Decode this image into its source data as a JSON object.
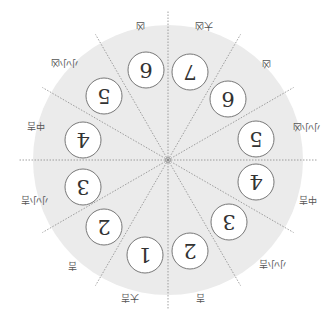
{
  "diagram": {
    "orientation": "rotated-180",
    "center": {
      "x": 168,
      "y": 160
    },
    "disc_radius": 135,
    "disc_color": "#ebebeb",
    "line_color": "#888888",
    "badge_radius": 18,
    "badges": [
      {
        "value": "7",
        "x": 190,
        "y": 72
      },
      {
        "value": "6",
        "x": 228,
        "y": 99
      },
      {
        "value": "5",
        "x": 256,
        "y": 139
      },
      {
        "value": "4",
        "x": 256,
        "y": 182
      },
      {
        "value": "3",
        "x": 229,
        "y": 222
      },
      {
        "value": "2",
        "x": 190,
        "y": 251
      },
      {
        "value": "1",
        "x": 145,
        "y": 255
      },
      {
        "value": "2",
        "x": 104,
        "y": 227
      },
      {
        "value": "3",
        "x": 83,
        "y": 187
      },
      {
        "value": "4",
        "x": 83,
        "y": 140
      },
      {
        "value": "5",
        "x": 104,
        "y": 96
      },
      {
        "value": "6",
        "x": 146,
        "y": 70
      }
    ],
    "labels": [
      {
        "text": "大凶",
        "x": 204,
        "y": 26
      },
      {
        "text": "凶",
        "x": 266,
        "y": 64
      },
      {
        "text": "小小凶",
        "x": 306,
        "y": 127
      },
      {
        "text": "中吉",
        "x": 308,
        "y": 200
      },
      {
        "text": "小小吉",
        "x": 272,
        "y": 264
      },
      {
        "text": "吉",
        "x": 200,
        "y": 298
      },
      {
        "text": "大吉",
        "x": 130,
        "y": 298
      },
      {
        "text": "吉",
        "x": 72,
        "y": 266
      },
      {
        "text": "小小吉",
        "x": 34,
        "y": 200
      },
      {
        "text": "中吉",
        "x": 36,
        "y": 126
      },
      {
        "text": "小小凶",
        "x": 64,
        "y": 63
      },
      {
        "text": "凶",
        "x": 140,
        "y": 26
      }
    ]
  }
}
